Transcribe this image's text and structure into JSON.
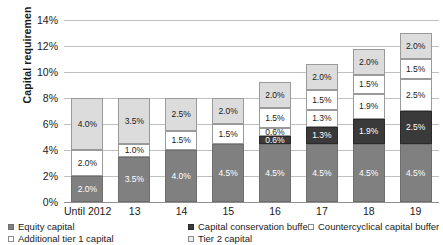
{
  "chart_data": {
    "type": "bar",
    "subtype": "stacked-bar",
    "title": "",
    "xlabel": "",
    "ylabel": "Capital requiremen",
    "ylim": [
      0,
      14
    ],
    "ytick_labels": [
      "14%",
      "12%",
      "10%",
      "8%",
      "6%",
      "4%",
      "2%",
      "0%"
    ],
    "ytick_values": [
      14,
      12,
      10,
      8,
      6,
      4,
      2,
      0
    ],
    "grid": true,
    "legend_position": "bottom",
    "value_label_suffix": "%",
    "categories": [
      "Until 2012",
      "13",
      "14",
      "15",
      "16",
      "17",
      "18",
      "19"
    ],
    "series": [
      {
        "name": "Equity capital",
        "color": "#808080",
        "values": [
          2.0,
          3.5,
          4.0,
          4.5,
          4.5,
          4.5,
          4.5,
          4.5
        ],
        "labels": [
          "2.0%",
          "3.5%",
          "4.0%",
          "4.5%",
          "4.5%",
          "4.5%",
          "4.5%",
          "4.5%"
        ]
      },
      {
        "name": "Capital conservation buffer",
        "color": "#3a3a3a",
        "values": [
          0,
          0,
          0,
          0,
          0.6,
          1.3,
          1.9,
          2.5
        ],
        "labels": [
          "",
          "",
          "",
          "",
          "0.6%",
          "1.3%",
          "1.9%",
          "2.5%"
        ]
      },
      {
        "name": "Countercyclical capital buffer",
        "color": "#ffffff",
        "values": [
          0,
          0,
          0,
          0,
          0.6,
          1.3,
          1.9,
          2.5
        ],
        "labels": [
          "",
          "",
          "",
          "",
          "0.6%",
          "1.3%",
          "1.9%",
          "2.5%"
        ]
      },
      {
        "name": "Additional tier 1 capital",
        "color": "#ffffff",
        "values": [
          2.0,
          1.0,
          1.5,
          1.5,
          1.5,
          1.5,
          1.5,
          1.5
        ],
        "labels": [
          "2.0%",
          "1.0%",
          "1.5%",
          "1.5%",
          "1.5%",
          "1.5%",
          "1.5%",
          "1.5%"
        ]
      },
      {
        "name": "Tier 2 capital",
        "color": "#dcdcdc",
        "values": [
          4.0,
          3.5,
          2.5,
          2.0,
          2.0,
          2.0,
          2.0,
          2.0
        ],
        "labels": [
          "4.0%",
          "3.5%",
          "2.5%",
          "2.0%",
          "2.0%",
          "2.0%",
          "2.0%",
          "2.0%"
        ]
      }
    ],
    "totals": [
      8.0,
      8.0,
      8.0,
      8.0,
      9.2,
      10.6,
      11.8,
      13.0
    ]
  },
  "legend": {
    "items": [
      {
        "label": "Equity capital"
      },
      {
        "label": "Capital conservation buffer"
      },
      {
        "label": "Countercyclical capital buffer"
      },
      {
        "label": "Additional tier 1 capital"
      },
      {
        "label": "Tier 2 capital"
      }
    ]
  }
}
